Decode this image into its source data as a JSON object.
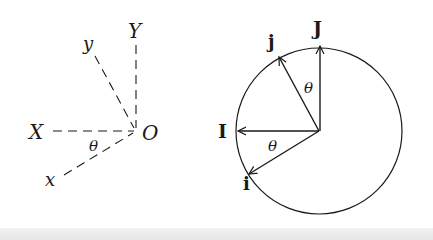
{
  "figure": {
    "left_diagram": {
      "title": "rotated axes",
      "origin_label": "O",
      "axis_labels": {
        "X": "X",
        "Y": "Y",
        "x": "x",
        "y": "y"
      },
      "angle_label": "θ"
    },
    "right_diagram": {
      "title": "unit circle with rotated basis vectors",
      "vector_labels": {
        "I": "I",
        "J": "J",
        "i": "i",
        "j": "j"
      },
      "angle_label_upper": "θ",
      "angle_label_lower": "θ"
    },
    "colors": {
      "ink": "#1a1a1a",
      "background": "#ffffff"
    }
  }
}
